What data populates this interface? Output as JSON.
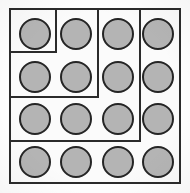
{
  "figure": {
    "type": "diagram",
    "canvas": {
      "width": 190,
      "height": 193
    },
    "background_color": "#ffffff",
    "paper_color": "#fbfbfb",
    "line_color": "#2b2b2b",
    "circle_fill": "#b4b4b4",
    "circle_stroke": "#252525",
    "grid": {
      "rows": 4,
      "cols": 4,
      "total_circles": 16
    }
  },
  "outer_frame": {
    "label": "outer-border",
    "x": 9,
    "y": 8,
    "width": 172,
    "height": 176,
    "stroke_width": 2
  },
  "circles": [
    {
      "id": "r1c1",
      "row": 1,
      "col": 1,
      "cx": 35,
      "cy": 34,
      "r": 16
    },
    {
      "id": "r1c2",
      "row": 1,
      "col": 2,
      "cx": 76,
      "cy": 34,
      "r": 16
    },
    {
      "id": "r1c3",
      "row": 1,
      "col": 3,
      "cx": 118,
      "cy": 34,
      "r": 16
    },
    {
      "id": "r1c4",
      "row": 1,
      "col": 4,
      "cx": 158,
      "cy": 34,
      "r": 16
    },
    {
      "id": "r2c1",
      "row": 2,
      "col": 1,
      "cx": 35,
      "cy": 77,
      "r": 16
    },
    {
      "id": "r2c2",
      "row": 2,
      "col": 2,
      "cx": 76,
      "cy": 77,
      "r": 16
    },
    {
      "id": "r2c3",
      "row": 2,
      "col": 3,
      "cx": 118,
      "cy": 77,
      "r": 16
    },
    {
      "id": "r2c4",
      "row": 2,
      "col": 4,
      "cx": 158,
      "cy": 77,
      "r": 16
    },
    {
      "id": "r3c1",
      "row": 3,
      "col": 1,
      "cx": 35,
      "cy": 119,
      "r": 16
    },
    {
      "id": "r3c2",
      "row": 3,
      "col": 2,
      "cx": 76,
      "cy": 119,
      "r": 16
    },
    {
      "id": "r3c3",
      "row": 3,
      "col": 3,
      "cx": 118,
      "cy": 119,
      "r": 16
    },
    {
      "id": "r3c4",
      "row": 3,
      "col": 4,
      "cx": 158,
      "cy": 119,
      "r": 16
    },
    {
      "id": "r4c1",
      "row": 4,
      "col": 1,
      "cx": 35,
      "cy": 162,
      "r": 16
    },
    {
      "id": "r4c2",
      "row": 4,
      "col": 2,
      "cx": 76,
      "cy": 162,
      "r": 16
    },
    {
      "id": "r4c3",
      "row": 4,
      "col": 3,
      "cx": 118,
      "cy": 162,
      "r": 16
    },
    {
      "id": "r4c4",
      "row": 4,
      "col": 4,
      "cx": 158,
      "cy": 162,
      "r": 16
    }
  ],
  "partitions": [
    {
      "id": "small-box-right-edge",
      "orientation": "vertical",
      "x": 55,
      "y": 8,
      "length": 45,
      "thickness": 2
    },
    {
      "id": "small-box-bottom-edge",
      "orientation": "horizontal",
      "x": 9,
      "y": 51,
      "length": 48,
      "thickness": 2
    },
    {
      "id": "upper-mid-vertical",
      "orientation": "vertical",
      "x": 97,
      "y": 8,
      "length": 90,
      "thickness": 2
    },
    {
      "id": "upper-left-horizontal",
      "orientation": "horizontal",
      "x": 9,
      "y": 96,
      "length": 90,
      "thickness": 2
    },
    {
      "id": "right-column-vertical",
      "orientation": "vertical",
      "x": 139,
      "y": 8,
      "length": 134,
      "thickness": 2
    },
    {
      "id": "lower-horizontal",
      "orientation": "horizontal",
      "x": 9,
      "y": 140,
      "length": 132,
      "thickness": 2
    }
  ],
  "regions": [
    {
      "id": "region-small-box",
      "label": "single-cell box (top-left)",
      "circle_count": 1
    },
    {
      "id": "region-L-shape",
      "label": "L-shaped region",
      "circle_count": 3
    },
    {
      "id": "region-right-col",
      "label": "right column strip",
      "circle_count": 3
    },
    {
      "id": "region-mid-strip",
      "label": "middle strip",
      "circle_count": 5
    },
    {
      "id": "region-bottom-row",
      "label": "bottom row",
      "circle_count": 4
    }
  ]
}
